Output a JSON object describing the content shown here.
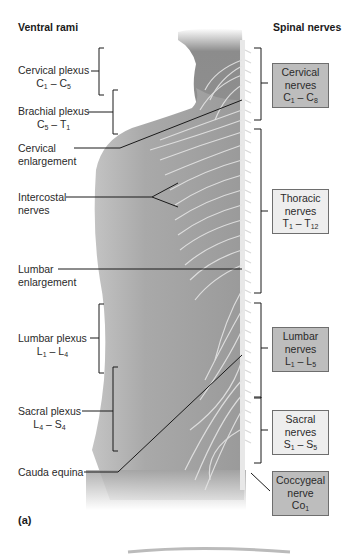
{
  "headers": {
    "left": "Ventral rami",
    "right": "Spinal nerves"
  },
  "panel_label": "(a)",
  "left_labels": [
    {
      "id": "cervical-plexus",
      "line1": "Cervical plexus",
      "range": {
        "a": "C",
        "a_sub": "1",
        "b": "C",
        "b_sub": "5"
      }
    },
    {
      "id": "brachial-plexus",
      "line1": "Brachial plexus",
      "range": {
        "a": "C",
        "a_sub": "5",
        "b": "T",
        "b_sub": "1"
      }
    },
    {
      "id": "cervical-enlargement",
      "line1": "Cervical",
      "line2": "enlargement"
    },
    {
      "id": "intercostal-nerves",
      "line1": "Intercostal",
      "line2": "nerves"
    },
    {
      "id": "lumbar-enlargement",
      "line1": "Lumbar",
      "line2": "enlargement"
    },
    {
      "id": "lumbar-plexus",
      "line1": "Lumbar plexus",
      "range": {
        "a": "L",
        "a_sub": "1",
        "b": "L",
        "b_sub": "4"
      }
    },
    {
      "id": "sacral-plexus",
      "line1": "Sacral plexus",
      "range": {
        "a": "L",
        "a_sub": "4",
        "b": "S",
        "b_sub": "4"
      }
    },
    {
      "id": "cauda-equina",
      "line1": "Cauda equina"
    }
  ],
  "right_boxes": [
    {
      "id": "cervical-nerves",
      "line1": "Cervical",
      "line2": "nerves",
      "range": {
        "a": "C",
        "a_sub": "1",
        "b": "C",
        "b_sub": "8"
      },
      "shade": "dark"
    },
    {
      "id": "thoracic-nerves",
      "line1": "Thoracic",
      "line2": "nerves",
      "range": {
        "a": "T",
        "a_sub": "1",
        "b": "T",
        "b_sub": "12"
      },
      "shade": "light"
    },
    {
      "id": "lumbar-nerves",
      "line1": "Lumbar",
      "line2": "nerves",
      "range": {
        "a": "L",
        "a_sub": "1",
        "b": "L",
        "b_sub": "5"
      },
      "shade": "dark"
    },
    {
      "id": "sacral-nerves",
      "line1": "Sacral",
      "line2": "nerves",
      "range": {
        "a": "S",
        "a_sub": "1",
        "b": "S",
        "b_sub": "5"
      },
      "shade": "light"
    },
    {
      "id": "coccygeal-nerve",
      "line1": "Coccygeal",
      "line2": "nerve",
      "range": {
        "a": "Co",
        "a_sub": "1"
      },
      "shade": "dark"
    }
  ],
  "separator": " – ",
  "colors": {
    "box_dark": "#bdbdbd",
    "box_light": "#eeeeee",
    "box_border": "#6e6e6e",
    "body_shade": "#9a9a9a",
    "nerve": "#e6e6e6",
    "leader_line": "#1a1a1a"
  }
}
